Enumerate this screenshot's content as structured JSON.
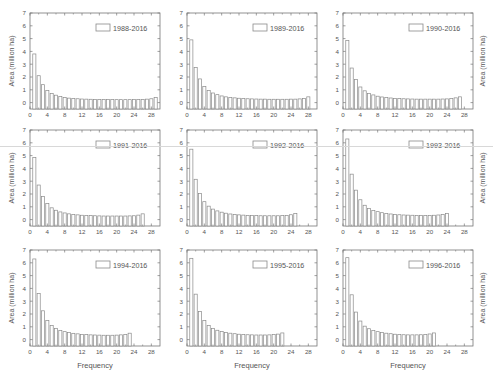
{
  "figure": {
    "layout": "3x3 grid of histograms",
    "shared_xlabel": "Frequency",
    "shared_ylabel": "Area (million ha)",
    "colors": {
      "bar_stroke": "#8a8a8a",
      "bar_fill": "#ffffff",
      "axis": "#777777",
      "text": "#555555"
    }
  },
  "chart_data": [
    {
      "type": "bar",
      "legend": "1988-2016",
      "xlabel": "",
      "ylabel": "Area (million ha)",
      "ylabel_side": "left",
      "xlim": [
        0,
        30
      ],
      "ylim": [
        -0.5,
        7
      ],
      "xticks": [
        0,
        4,
        8,
        12,
        16,
        20,
        24,
        28
      ],
      "yticks": [
        0,
        1,
        2,
        3,
        4,
        5,
        6,
        7
      ],
      "x": [
        1,
        2,
        3,
        4,
        5,
        6,
        7,
        8,
        9,
        10,
        11,
        12,
        13,
        14,
        15,
        16,
        17,
        18,
        19,
        20,
        21,
        22,
        23,
        24,
        25,
        26,
        27,
        28,
        29
      ],
      "values": [
        3.8,
        2.1,
        1.4,
        0.95,
        0.7,
        0.58,
        0.48,
        0.4,
        0.35,
        0.32,
        0.3,
        0.28,
        0.27,
        0.26,
        0.25,
        0.25,
        0.24,
        0.24,
        0.24,
        0.23,
        0.23,
        0.23,
        0.23,
        0.24,
        0.24,
        0.25,
        0.27,
        0.3,
        0.4
      ]
    },
    {
      "type": "bar",
      "legend": "1989-2016",
      "xlabel": "",
      "ylabel": "",
      "ylabel_side": "none",
      "xlim": [
        0,
        30
      ],
      "ylim": [
        -0.5,
        7
      ],
      "xticks": [
        0,
        4,
        8,
        12,
        16,
        20,
        24,
        28
      ],
      "yticks": [
        0,
        1,
        2,
        3,
        4,
        5,
        6,
        7
      ],
      "x": [
        1,
        2,
        3,
        4,
        5,
        6,
        7,
        8,
        9,
        10,
        11,
        12,
        13,
        14,
        15,
        16,
        17,
        18,
        19,
        20,
        21,
        22,
        23,
        24,
        25,
        26,
        27,
        28
      ],
      "values": [
        4.9,
        2.75,
        1.85,
        1.25,
        0.95,
        0.75,
        0.62,
        0.52,
        0.45,
        0.4,
        0.37,
        0.34,
        0.32,
        0.3,
        0.29,
        0.28,
        0.27,
        0.27,
        0.26,
        0.26,
        0.26,
        0.26,
        0.26,
        0.27,
        0.27,
        0.29,
        0.32,
        0.45
      ]
    },
    {
      "type": "bar",
      "legend": "1990-2016",
      "xlabel": "",
      "ylabel": "Area (million ha)",
      "ylabel_side": "right",
      "xlim": [
        0,
        30
      ],
      "ylim": [
        -0.5,
        7
      ],
      "xticks": [
        0,
        4,
        8,
        12,
        16,
        20,
        24,
        28
      ],
      "yticks": [
        0,
        1,
        2,
        3,
        4,
        5,
        6,
        7
      ],
      "x": [
        1,
        2,
        3,
        4,
        5,
        6,
        7,
        8,
        9,
        10,
        11,
        12,
        13,
        14,
        15,
        16,
        17,
        18,
        19,
        20,
        21,
        22,
        23,
        24,
        25,
        26,
        27
      ],
      "values": [
        4.85,
        2.7,
        1.8,
        1.22,
        0.92,
        0.72,
        0.6,
        0.5,
        0.44,
        0.39,
        0.36,
        0.33,
        0.31,
        0.3,
        0.29,
        0.28,
        0.27,
        0.27,
        0.27,
        0.27,
        0.27,
        0.27,
        0.28,
        0.29,
        0.31,
        0.37,
        0.45
      ]
    },
    {
      "type": "bar",
      "legend": "1991-2016",
      "xlabel": "",
      "ylabel": "Area (million ha)",
      "ylabel_side": "left",
      "xlim": [
        0,
        30
      ],
      "ylim": [
        -0.5,
        7
      ],
      "xticks": [
        0,
        4,
        8,
        12,
        16,
        20,
        24,
        28
      ],
      "yticks": [
        0,
        1,
        2,
        3,
        4,
        5,
        6,
        7
      ],
      "x": [
        1,
        2,
        3,
        4,
        5,
        6,
        7,
        8,
        9,
        10,
        11,
        12,
        13,
        14,
        15,
        16,
        17,
        18,
        19,
        20,
        21,
        22,
        23,
        24,
        25,
        26
      ],
      "values": [
        4.85,
        2.7,
        1.8,
        1.25,
        0.92,
        0.73,
        0.6,
        0.52,
        0.45,
        0.4,
        0.37,
        0.34,
        0.32,
        0.31,
        0.3,
        0.29,
        0.28,
        0.28,
        0.28,
        0.28,
        0.28,
        0.28,
        0.29,
        0.3,
        0.35,
        0.45
      ]
    },
    {
      "type": "bar",
      "legend": "1992-2016",
      "xlabel": "",
      "ylabel": "",
      "ylabel_side": "none",
      "xlim": [
        0,
        30
      ],
      "ylim": [
        -0.5,
        7
      ],
      "xticks": [
        0,
        4,
        8,
        12,
        16,
        20,
        24,
        28
      ],
      "yticks": [
        0,
        1,
        2,
        3,
        4,
        5,
        6,
        7
      ],
      "x": [
        1,
        2,
        3,
        4,
        5,
        6,
        7,
        8,
        9,
        10,
        11,
        12,
        13,
        14,
        15,
        16,
        17,
        18,
        19,
        20,
        21,
        22,
        23,
        24,
        25
      ],
      "values": [
        5.5,
        3.15,
        2.05,
        1.4,
        1.05,
        0.82,
        0.68,
        0.58,
        0.5,
        0.44,
        0.4,
        0.37,
        0.35,
        0.33,
        0.32,
        0.31,
        0.3,
        0.3,
        0.3,
        0.3,
        0.3,
        0.31,
        0.33,
        0.38,
        0.48
      ]
    },
    {
      "type": "bar",
      "legend": "1993-2016",
      "xlabel": "",
      "ylabel": "Area (million ha)",
      "ylabel_side": "right",
      "xlim": [
        0,
        30
      ],
      "ylim": [
        -0.5,
        7
      ],
      "xticks": [
        0,
        4,
        8,
        12,
        16,
        20,
        24,
        28
      ],
      "yticks": [
        0,
        1,
        2,
        3,
        4,
        5,
        6,
        7
      ],
      "x": [
        1,
        2,
        3,
        4,
        5,
        6,
        7,
        8,
        9,
        10,
        11,
        12,
        13,
        14,
        15,
        16,
        17,
        18,
        19,
        20,
        21,
        22,
        23,
        24
      ],
      "values": [
        6.3,
        3.55,
        2.3,
        1.55,
        1.12,
        0.88,
        0.72,
        0.62,
        0.54,
        0.48,
        0.44,
        0.4,
        0.38,
        0.36,
        0.35,
        0.34,
        0.33,
        0.33,
        0.33,
        0.33,
        0.34,
        0.36,
        0.4,
        0.48
      ]
    },
    {
      "type": "bar",
      "legend": "1994-2016",
      "xlabel": "Frequency",
      "ylabel": "Area (million ha)",
      "ylabel_side": "left",
      "xlim": [
        0,
        30
      ],
      "ylim": [
        -0.5,
        7
      ],
      "xticks": [
        0,
        4,
        8,
        12,
        16,
        20,
        24,
        28
      ],
      "yticks": [
        0,
        1,
        2,
        3,
        4,
        5,
        6,
        7
      ],
      "x": [
        1,
        2,
        3,
        4,
        5,
        6,
        7,
        8,
        9,
        10,
        11,
        12,
        13,
        14,
        15,
        16,
        17,
        18,
        19,
        20,
        21,
        22,
        23
      ],
      "values": [
        6.3,
        3.6,
        2.25,
        1.5,
        1.1,
        0.88,
        0.72,
        0.62,
        0.55,
        0.49,
        0.45,
        0.41,
        0.39,
        0.37,
        0.36,
        0.35,
        0.34,
        0.34,
        0.34,
        0.35,
        0.37,
        0.41,
        0.5
      ]
    },
    {
      "type": "bar",
      "legend": "1995-2016",
      "xlabel": "Frequency",
      "ylabel": "",
      "ylabel_side": "none",
      "xlim": [
        0,
        30
      ],
      "ylim": [
        -0.5,
        7
      ],
      "xticks": [
        0,
        4,
        8,
        12,
        16,
        20,
        24,
        28
      ],
      "yticks": [
        0,
        1,
        2,
        3,
        4,
        5,
        6,
        7
      ],
      "x": [
        1,
        2,
        3,
        4,
        5,
        6,
        7,
        8,
        9,
        10,
        11,
        12,
        13,
        14,
        15,
        16,
        17,
        18,
        19,
        20,
        21,
        22
      ],
      "values": [
        6.35,
        3.55,
        2.2,
        1.5,
        1.1,
        0.88,
        0.73,
        0.63,
        0.56,
        0.5,
        0.46,
        0.42,
        0.4,
        0.38,
        0.37,
        0.36,
        0.36,
        0.36,
        0.37,
        0.39,
        0.43,
        0.52
      ]
    },
    {
      "type": "bar",
      "legend": "1996-2016",
      "xlabel": "Frequency",
      "ylabel": "Area (million ha)",
      "ylabel_side": "right",
      "xlim": [
        0,
        30
      ],
      "ylim": [
        -0.5,
        7
      ],
      "xticks": [
        0,
        4,
        8,
        12,
        16,
        20,
        24,
        28
      ],
      "yticks": [
        0,
        1,
        2,
        3,
        4,
        5,
        6,
        7
      ],
      "x": [
        1,
        2,
        3,
        4,
        5,
        6,
        7,
        8,
        9,
        10,
        11,
        12,
        13,
        14,
        15,
        16,
        17,
        18,
        19,
        20,
        21
      ],
      "values": [
        6.4,
        3.5,
        2.15,
        1.45,
        1.05,
        0.85,
        0.72,
        0.62,
        0.55,
        0.5,
        0.46,
        0.42,
        0.4,
        0.38,
        0.37,
        0.37,
        0.37,
        0.38,
        0.4,
        0.44,
        0.52
      ]
    }
  ]
}
